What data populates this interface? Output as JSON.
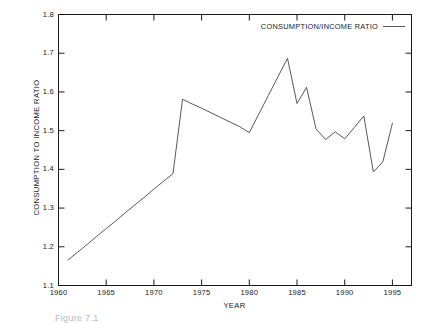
{
  "figure": {
    "background": "#ffffff",
    "line_color": "#555a60",
    "axis_color": "#1a1a1a",
    "caption": "Figure 7.1"
  },
  "legend": {
    "entry": "CONSUMPTION/INCOME RATIO",
    "swatch": "line-sample"
  },
  "chart_data": {
    "type": "line",
    "title": "",
    "xlabel": "YEAR",
    "ylabel": "CONSUMPTION TO INCOME RATIO",
    "xlim": [
      1960,
      1997
    ],
    "ylim": [
      1.1,
      1.8
    ],
    "xticks": [
      1960,
      1965,
      1970,
      1975,
      1980,
      1985,
      1990,
      1995
    ],
    "xtick_labels": [
      "1960",
      "1965",
      "1970",
      "1975",
      "1980",
      "1985",
      "1990",
      "1995"
    ],
    "yticks": [
      1.1,
      1.2,
      1.3,
      1.4,
      1.5,
      1.6,
      1.7,
      1.8
    ],
    "ytick_labels": [
      "1.1",
      "1.2",
      "1.3",
      "1.4",
      "1.5",
      "1.6",
      "1.7",
      "1.8"
    ],
    "grid": false,
    "legend_position": "top-right-inside",
    "series": [
      {
        "name": "CONSUMPTION/INCOME RATIO",
        "color": "#555a60",
        "x": [
          1961,
          1962,
          1963,
          1964,
          1965,
          1966,
          1967,
          1968,
          1969,
          1970,
          1971,
          1972,
          1973,
          1974,
          1975,
          1976,
          1977,
          1978,
          1979,
          1980,
          1981,
          1982,
          1983,
          1984,
          1985,
          1986,
          1987,
          1988,
          1989,
          1990,
          1991,
          1992,
          1993,
          1994,
          1995
        ],
        "y": [
          1.166,
          1.186,
          1.206,
          1.227,
          1.247,
          1.267,
          1.288,
          1.308,
          1.328,
          1.349,
          1.369,
          1.389,
          1.581,
          1.569,
          1.558,
          1.546,
          1.534,
          1.522,
          1.51,
          1.495,
          1.543,
          1.591,
          1.639,
          1.687,
          1.57,
          1.612,
          1.504,
          1.477,
          1.497,
          1.479,
          1.508,
          1.538,
          1.393,
          1.42,
          1.519
        ]
      }
    ]
  }
}
